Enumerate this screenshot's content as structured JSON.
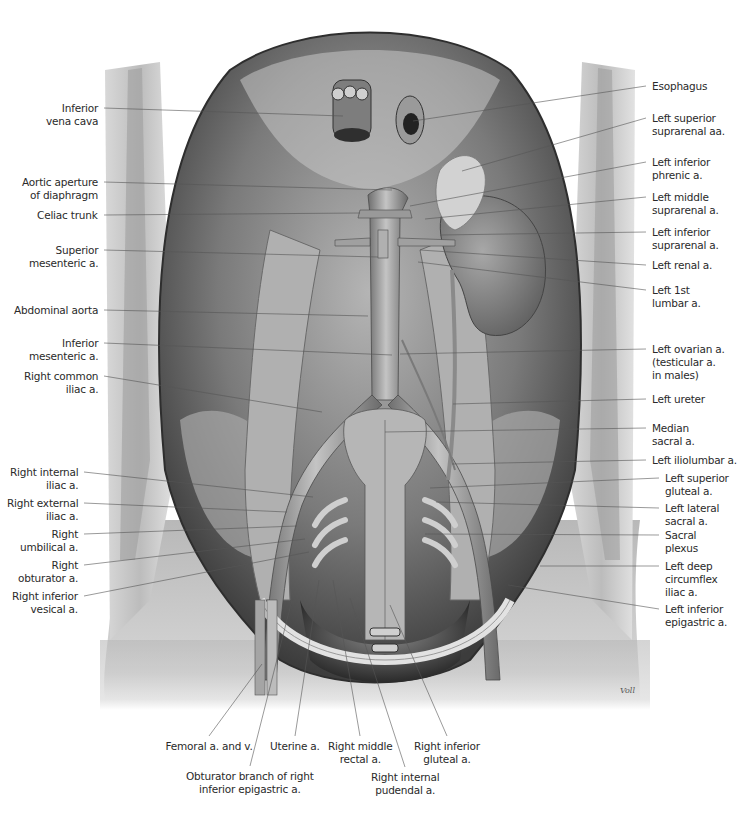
{
  "figure": {
    "colors": {
      "background": "#ffffff",
      "cavity_dark": "#3a3a3a",
      "tissue_mid": "#8c8c8c",
      "tissue_light": "#cfcfcf",
      "vessel": "#9a9a9a",
      "leader_line": "#555555",
      "label_text": "#2a2a2a"
    },
    "signature": "Voll",
    "labels_left": [
      {
        "id": "inferior-vena-cava",
        "text": "Inferior\nvena cava",
        "x": 98,
        "y": 108,
        "tx": 343,
        "ty": 116
      },
      {
        "id": "aortic-aperture",
        "text": "Aortic aperture\nof diaphragm",
        "x": 98,
        "y": 182,
        "tx": 392,
        "ty": 190
      },
      {
        "id": "celiac-trunk",
        "text": "Celiac trunk",
        "x": 98,
        "y": 215,
        "tx": 360,
        "ty": 213
      },
      {
        "id": "superior-mesenteric",
        "text": "Superior\nmesenteric a.",
        "x": 98,
        "y": 250,
        "tx": 378,
        "ty": 257
      },
      {
        "id": "abdominal-aorta",
        "text": "Abdominal aorta",
        "x": 98,
        "y": 310,
        "tx": 368,
        "ty": 316
      },
      {
        "id": "inferior-mesenteric",
        "text": "Inferior\nmesenteric a.",
        "x": 98,
        "y": 343,
        "tx": 392,
        "ty": 355
      },
      {
        "id": "right-common-iliac",
        "text": "Right common\niliac a.",
        "x": 98,
        "y": 376,
        "tx": 322,
        "ty": 412
      },
      {
        "id": "right-internal-iliac",
        "text": "Right internal\niliac a.",
        "x": 78,
        "y": 472,
        "tx": 313,
        "ty": 497
      },
      {
        "id": "right-external-iliac",
        "text": "Right external\niliac a.",
        "x": 78,
        "y": 503,
        "tx": 287,
        "ty": 512
      },
      {
        "id": "right-umbilical",
        "text": "Right\numbilical a.",
        "x": 78,
        "y": 534,
        "tx": 297,
        "ty": 526
      },
      {
        "id": "right-obturator",
        "text": "Right\nobturator a.",
        "x": 78,
        "y": 565,
        "tx": 305,
        "ty": 539
      },
      {
        "id": "right-inferior-vesical",
        "text": "Right inferior\nvesical a.",
        "x": 78,
        "y": 596,
        "tx": 309,
        "ty": 552
      }
    ],
    "labels_right": [
      {
        "id": "esophagus",
        "text": "Esophagus",
        "x": 652,
        "y": 86,
        "tx": 413,
        "ty": 121
      },
      {
        "id": "left-superior-suprarenal",
        "text": "Left superior\nsuprarenal aa.",
        "x": 652,
        "y": 118,
        "tx": 462,
        "ty": 171
      },
      {
        "id": "left-inferior-phrenic",
        "text": "Left inferior\nphrenic a.",
        "x": 652,
        "y": 162,
        "tx": 410,
        "ty": 206
      },
      {
        "id": "left-middle-suprarenal",
        "text": "Left middle\nsuprarenal a.",
        "x": 652,
        "y": 197,
        "tx": 425,
        "ty": 219
      },
      {
        "id": "left-inferior-suprarenal",
        "text": "Left inferior\nsuprarenal a.",
        "x": 652,
        "y": 232,
        "tx": 440,
        "ty": 235
      },
      {
        "id": "left-renal",
        "text": "Left renal a.",
        "x": 652,
        "y": 265,
        "tx": 420,
        "ty": 250
      },
      {
        "id": "left-1st-lumbar",
        "text": "Left 1st\nlumbar a.",
        "x": 652,
        "y": 290,
        "tx": 418,
        "ty": 262
      },
      {
        "id": "left-ovarian",
        "text": "Left ovarian a.\n(testicular a.\nin males)",
        "x": 652,
        "y": 349,
        "tx": 400,
        "ty": 354
      },
      {
        "id": "left-ureter",
        "text": "Left ureter",
        "x": 652,
        "y": 399,
        "tx": 453,
        "ty": 404
      },
      {
        "id": "median-sacral",
        "text": "Median\nsacral a.",
        "x": 652,
        "y": 428,
        "tx": 385,
        "ty": 432
      },
      {
        "id": "left-iliolumbar",
        "text": "Left iliolumbar a.",
        "x": 652,
        "y": 460,
        "tx": 452,
        "ty": 464
      },
      {
        "id": "left-superior-gluteal",
        "text": "Left superior\ngluteal a.",
        "x": 665,
        "y": 478,
        "tx": 430,
        "ty": 488
      },
      {
        "id": "left-lateral-sacral",
        "text": "Left lateral\nsacral a.",
        "x": 665,
        "y": 508,
        "tx": 436,
        "ty": 502
      },
      {
        "id": "sacral-plexus",
        "text": "Sacral\nplexus",
        "x": 665,
        "y": 535,
        "tx": 425,
        "ty": 534
      },
      {
        "id": "left-deep-circumflex-iliac",
        "text": "Left deep\ncircumflex\niliac a.",
        "x": 665,
        "y": 566,
        "tx": 540,
        "ty": 566
      },
      {
        "id": "left-inferior-epigastric",
        "text": "Left inferior\nepigastric a.",
        "x": 665,
        "y": 609,
        "tx": 508,
        "ty": 585
      }
    ],
    "labels_bottom": [
      {
        "id": "femoral",
        "text": "Femoral a. and v.",
        "x": 209,
        "y": 740,
        "tx": 262,
        "ty": 664
      },
      {
        "id": "obturator-branch",
        "text": "Obturator branch of right\ninferior epigastric a.",
        "x": 250,
        "y": 770,
        "tx": 292,
        "ty": 600
      },
      {
        "id": "uterine",
        "text": "Uterine a.",
        "x": 295,
        "y": 740,
        "tx": 319,
        "ty": 580
      },
      {
        "id": "right-middle-rectal",
        "text": "Right middle\nrectal a.",
        "x": 360,
        "y": 740,
        "tx": 333,
        "ty": 580
      },
      {
        "id": "right-internal-pudendal",
        "text": "Right internal\npudendal a.",
        "x": 405,
        "y": 771,
        "tx": 350,
        "ty": 598
      },
      {
        "id": "right-inferior-gluteal",
        "text": "Right inferior\ngluteal a.",
        "x": 447,
        "y": 740,
        "tx": 390,
        "ty": 605
      }
    ]
  }
}
